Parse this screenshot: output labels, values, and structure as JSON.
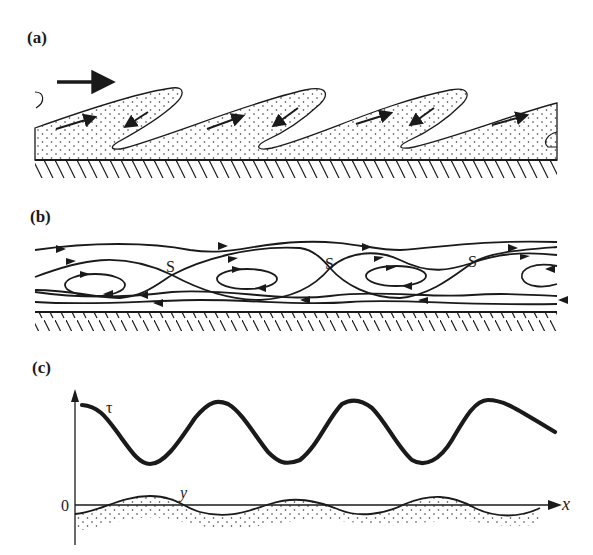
{
  "figure": {
    "panels": [
      {
        "label": "(a)",
        "description": "Dotted fluid layer forming tongue-like lobes over a hatched wall, with flow arrows",
        "flow_direction_arrow": "right"
      },
      {
        "label": "(b)",
        "description": "Streamlines with recirculating eddies and saddle points over a hatched wall",
        "saddle_labels": [
          "S",
          "S",
          "S"
        ]
      },
      {
        "label": "(c)",
        "description": "Wall shear stress tau and interface displacement y versus x",
        "curve_labels": {
          "tau": "τ",
          "y": "y"
        },
        "axis_labels": {
          "x": "x",
          "origin": "0"
        }
      }
    ]
  }
}
